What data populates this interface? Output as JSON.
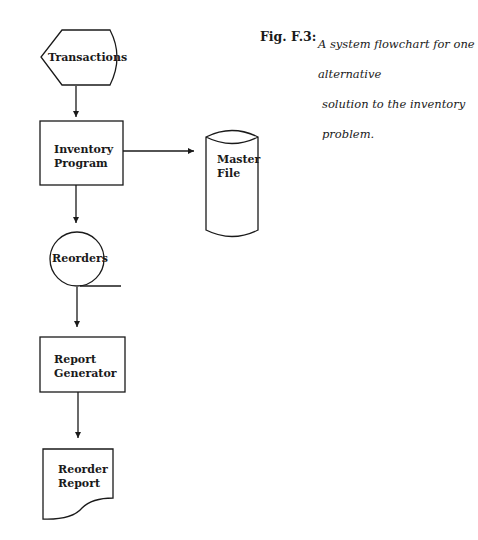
{
  "caption": {
    "number": "Fig. F.3:",
    "line1": "A system flowchart for one alternative",
    "line2": "solution to the inventory problem."
  },
  "nodes": {
    "transactions": {
      "label": "Transactions",
      "shape": "online-input"
    },
    "inventory_program": {
      "line1": "Inventory",
      "line2": "Program",
      "shape": "process"
    },
    "master_file": {
      "line1": "Master",
      "line2": "File",
      "shape": "magnetic-disk"
    },
    "reorders": {
      "label": "Reorders",
      "shape": "magnetic-tape"
    },
    "report_generator": {
      "line1": "Report",
      "line2": "Generator",
      "shape": "process"
    },
    "reorder_report": {
      "line1": "Reorder",
      "line2": "Report",
      "shape": "document"
    }
  },
  "edges": [
    {
      "from": "Transactions",
      "to": "Inventory Program"
    },
    {
      "from": "Inventory Program",
      "to": "Master File"
    },
    {
      "from": "Inventory Program",
      "to": "Reorders"
    },
    {
      "from": "Reorders",
      "to": "Report Generator"
    },
    {
      "from": "Report Generator",
      "to": "Reorder Report"
    }
  ]
}
